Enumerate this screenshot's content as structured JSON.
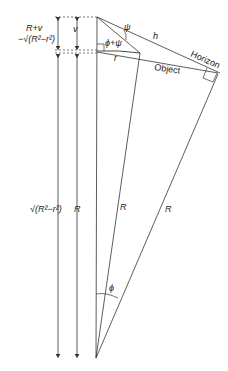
{
  "diagram": {
    "type": "geometry",
    "labels": {
      "left_top_line1": "R+v",
      "left_top_line2": "−√(R²−r²)",
      "v": "v",
      "psi": "ψ",
      "phi_plus_psi": "ϕ+ψ",
      "h": "h",
      "r": "r",
      "object": "Object",
      "horizon": "Horizon",
      "left_bottom": "√(R²−r²)",
      "R_vertical": "R",
      "R_middle": "R",
      "R_right": "R",
      "phi": "ϕ"
    },
    "colors": {
      "line": "#333333",
      "text": "#222222",
      "background": "#ffffff"
    }
  }
}
